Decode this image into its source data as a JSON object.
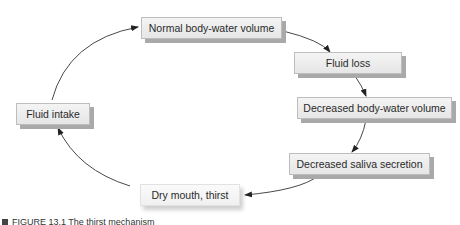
{
  "diagram": {
    "type": "cycle",
    "nodes": [
      {
        "id": "normal",
        "label": "Normal body-water volume"
      },
      {
        "id": "loss",
        "label": "Fluid loss"
      },
      {
        "id": "decreased_volume",
        "label": "Decreased body-water volume"
      },
      {
        "id": "saliva",
        "label": "Decreased saliva secretion"
      },
      {
        "id": "dry_mouth",
        "label": "Dry mouth, thirst"
      },
      {
        "id": "intake",
        "label": "Fluid intake"
      }
    ],
    "edges": [
      {
        "from": "normal",
        "to": "loss"
      },
      {
        "from": "loss",
        "to": "decreased_volume"
      },
      {
        "from": "decreased_volume",
        "to": "saliva"
      },
      {
        "from": "saliva",
        "to": "dry_mouth"
      },
      {
        "from": "dry_mouth",
        "to": "intake"
      },
      {
        "from": "intake",
        "to": "normal"
      }
    ],
    "caption": "FIGURE 13.1  The thirst mechanism"
  }
}
